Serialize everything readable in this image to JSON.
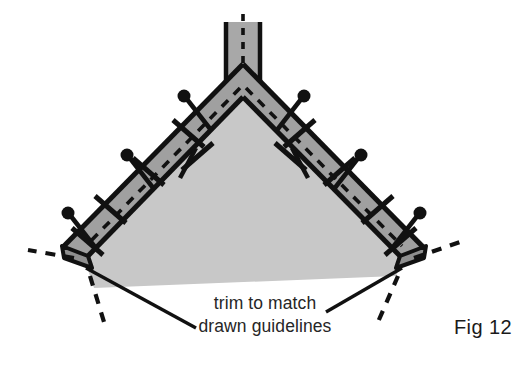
{
  "figure": {
    "kind": "sewing-construction-diagram",
    "caption_lines": [
      "trim to match",
      "drawn guidelines"
    ],
    "figure_number_label": "Fig 12",
    "background_color": "#ffffff",
    "colors": {
      "background": "#ffffff",
      "band_fill": "#a0a0a0",
      "interior_fill": "#c8c8c8",
      "outline": "#111111",
      "pin": "#111111",
      "guideline": "#111111",
      "caption_text": "#262626",
      "fig_label_text": "#1a1a1a"
    },
    "geometry": {
      "apex": {
        "x": 243,
        "y": 82
      },
      "strip": {
        "left": 224,
        "right": 262,
        "top": 22,
        "bottom": 82
      },
      "left_corner": {
        "x": 72,
        "y": 262
      },
      "right_corner": {
        "x": 414,
        "y": 262
      },
      "band_width": 30,
      "interior_bottom_left": {
        "x": 92,
        "y": 290
      },
      "interior_bottom_right": {
        "x": 396,
        "y": 276
      }
    },
    "elements": {
      "vertical_strip_label": "seam allowance strip",
      "left_band_label": "left diagonal band",
      "right_band_label": "right diagonal band",
      "interior_label": "interior panel",
      "center_dashed_label": "center drawn guideline",
      "left_dashed_label": "left drawn guideline",
      "right_dashed_label": "right drawn guideline",
      "left_trim_label": "left trim guideline",
      "right_trim_label": "right trim guideline"
    },
    "pins": {
      "count": 12,
      "left_outer": [
        {
          "x": 196,
          "y": 103,
          "angle": 58
        },
        {
          "x": 152,
          "y": 148,
          "angle": 58
        },
        {
          "x": 117,
          "y": 183,
          "angle": 58
        },
        {
          "x": 80,
          "y": 220,
          "angle": 58
        }
      ],
      "right_outer": [
        {
          "x": 292,
          "y": 104,
          "angle": -58
        },
        {
          "x": 333,
          "y": 144,
          "angle": -58
        },
        {
          "x": 368,
          "y": 180,
          "angle": -58
        },
        {
          "x": 404,
          "y": 218,
          "angle": -58
        }
      ],
      "inner": [
        {
          "x": 196,
          "y": 170,
          "angle": 58
        },
        {
          "x": 292,
          "y": 170,
          "angle": -58
        }
      ],
      "corner": [
        {
          "x": 92,
          "y": 241,
          "angle": 58
        },
        {
          "x": 394,
          "y": 241,
          "angle": -58
        }
      ]
    },
    "tick_marks": {
      "left_band": [
        {
          "x": 188,
          "y": 120
        },
        {
          "x": 148,
          "y": 160
        },
        {
          "x": 108,
          "y": 200
        },
        {
          "x": 85,
          "y": 235
        }
      ],
      "right_band": [
        {
          "x": 300,
          "y": 120
        },
        {
          "x": 340,
          "y": 160
        },
        {
          "x": 376,
          "y": 200
        },
        {
          "x": 400,
          "y": 235
        }
      ]
    }
  }
}
